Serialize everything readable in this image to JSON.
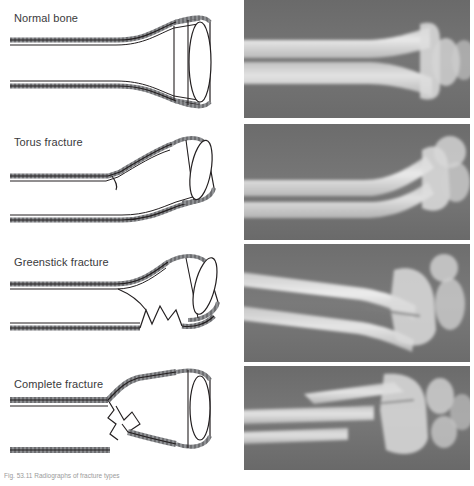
{
  "figure": {
    "caption": "Fig. 53.11 Radiographs of fracture types",
    "panel_count": 4,
    "colors": {
      "bone_outline": "#231f20",
      "periosteum": "#6d6e71",
      "label_text": "#3a3a3c",
      "xray_background": "#6e6e6e",
      "xray_bone": "#e8e8e8",
      "page_background": "#ffffff"
    }
  },
  "rows": [
    {
      "id": "normal-bone",
      "label": "Normal bone",
      "diagram_type": "intact-shaft",
      "xray_description": "Lateral radiograph of an intact distal radius and ulna with smooth unbroken cortices"
    },
    {
      "id": "torus-fracture",
      "label": "Torus fracture",
      "diagram_type": "buckled-cortex",
      "xray_description": "Radiograph showing a buckle (torus) of the dorsal cortex of the distal radius"
    },
    {
      "id": "greenstick-fracture",
      "label": "Greenstick fracture",
      "diagram_type": "incomplete-break",
      "xray_description": "Radiograph showing an incomplete greenstick fracture angulated at the distal radius"
    },
    {
      "id": "complete-fracture",
      "label": "Complete fracture",
      "diagram_type": "complete-break",
      "xray_description": "Radiograph showing complete displaced fractures of both the radius and ulna"
    }
  ]
}
